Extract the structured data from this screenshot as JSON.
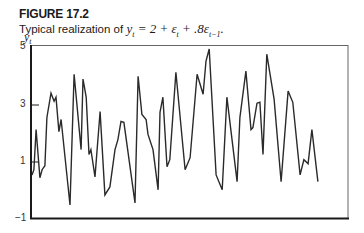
{
  "figure": {
    "label": "FIGURE 17.2",
    "caption_prefix": "Typical realization of ",
    "caption_equation": "y_t = 2 + ε_t + .8ε_{t−1}."
  },
  "chart_data": {
    "type": "line",
    "xlabel": "",
    "ylabel": "y_t",
    "ylim": [
      -1,
      5
    ],
    "yticks": [
      -1,
      1,
      3,
      5
    ],
    "grid": false,
    "legend": null,
    "x_note": "x positions normalized 0–100 across horizontal axis (time t); no x tick labels shown",
    "series": [
      {
        "name": "y_t",
        "x": [
          0.3,
          0.9,
          1.6,
          2.8,
          3.5,
          4.4,
          5.0,
          6.3,
          7.3,
          7.9,
          8.8,
          9.5,
          12.3,
          13.6,
          15.8,
          16.4,
          17.4,
          18.3,
          18.9,
          20.2,
          21.8,
          23.3,
          24.9,
          26.5,
          27.4,
          28.4,
          29.3,
          32.8,
          33.8,
          35.0,
          36.3,
          36.9,
          38.5,
          40.1,
          40.7,
          41.6,
          42.9,
          43.8,
          45.7,
          48.6,
          50.2,
          52.4,
          54.3,
          55.2,
          56.2,
          58.4,
          60.3,
          61.8,
          65.0,
          65.9,
          67.8,
          69.4,
          70.0,
          71.3,
          72.2,
          73.2,
          74.4,
          76.7,
          78.9,
          81.1,
          82.6,
          84.9,
          86.1,
          87.4,
          88.6,
          90.5
        ],
        "values": [
          0.54,
          0.72,
          2.12,
          0.44,
          0.72,
          0.86,
          2.54,
          3.39,
          3.11,
          3.25,
          2.05,
          2.47,
          -0.51,
          4.05,
          1.42,
          3.88,
          3.25,
          1.25,
          1.42,
          0.47,
          2.75,
          -0.16,
          0.12,
          1.42,
          1.77,
          2.4,
          2.37,
          -0.44,
          3.98,
          2.65,
          2.47,
          1.95,
          1.42,
          0.02,
          2.72,
          3.25,
          0.82,
          1.07,
          4.12,
          0.72,
          1.14,
          4.05,
          3.35,
          4.51,
          4.93,
          0.54,
          0.02,
          3.25,
          0.3,
          2.54,
          4.16,
          2.12,
          2.19,
          3.04,
          3.07,
          1.25,
          4.75,
          3.18,
          0.3,
          3.46,
          3.07,
          0.54,
          1.07,
          0.93,
          2.12,
          0.3
        ]
      }
    ]
  },
  "axis": {
    "ylabel": "y",
    "ylabel_sub": "t",
    "tick_labels": [
      "5",
      "3",
      "1",
      "−1"
    ]
  },
  "colors": {
    "line": "#2a2a2a",
    "axis": "#1a1a1a",
    "frame": "#555555"
  }
}
